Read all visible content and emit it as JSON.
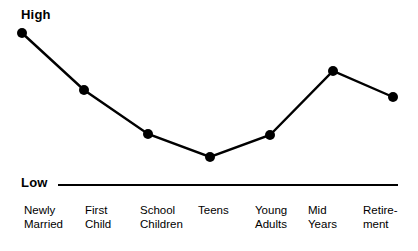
{
  "chart_data": {
    "type": "line",
    "title": "",
    "subtitle": "",
    "xlabel": "",
    "ylabel": "",
    "ylim": [
      0,
      100
    ],
    "y_axis_ticks": [
      "Low",
      "High"
    ],
    "grid": false,
    "legend": false,
    "markers": "filled-circle",
    "categories": [
      "Newly Married",
      "First Child",
      "School Children",
      "Teens",
      "Young Adults",
      "Mid Years",
      "Retirement"
    ],
    "category_lines": [
      [
        "Newly",
        "Married"
      ],
      [
        "First",
        "Child"
      ],
      [
        "School",
        "Children"
      ],
      [
        "Teens",
        ""
      ],
      [
        "Young",
        "Adults"
      ],
      [
        "Mid",
        "Years"
      ],
      [
        "Retire-",
        "ment"
      ]
    ],
    "values": [
      95,
      59,
      32,
      18,
      31,
      71,
      55
    ],
    "series": [
      {
        "name": "",
        "values": [
          95,
          59,
          32,
          18,
          31,
          71,
          55
        ]
      }
    ],
    "pixel_points": [
      [
        22,
        33
      ],
      [
        84,
        90
      ],
      [
        148,
        134
      ],
      [
        210,
        157
      ],
      [
        270,
        135
      ],
      [
        333,
        71
      ],
      [
        393,
        97
      ]
    ],
    "axis_baseline_y": 185,
    "axis_baseline_x_start": 58,
    "axis_baseline_x_end": 398,
    "colors": {
      "line": "#000000",
      "marker": "#000000",
      "axis": "#000000",
      "background": "#ffffff",
      "text": "#000000"
    }
  },
  "axis": {
    "high_label": "High",
    "low_label": "Low"
  },
  "category_label_x": [
    24,
    85,
    140,
    198,
    255,
    308,
    363
  ]
}
